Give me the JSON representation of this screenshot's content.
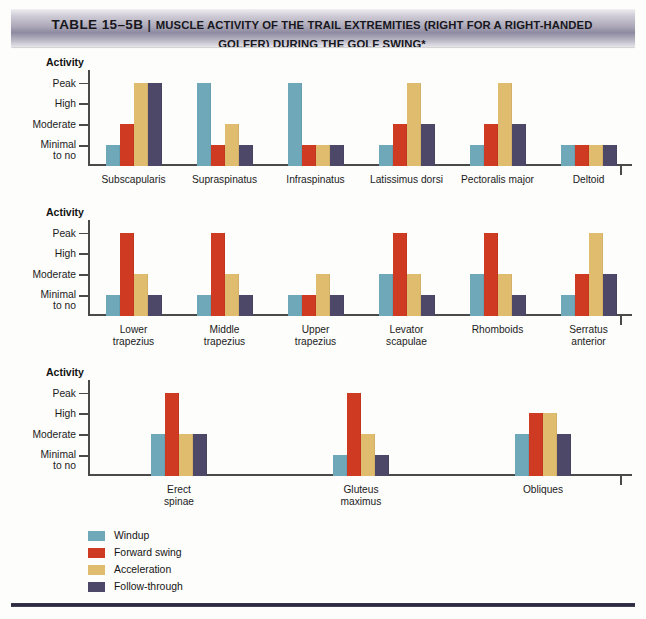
{
  "header": {
    "table_number": "TABLE 15–5B",
    "separator": "|",
    "title_line1": "MUSCLE ACTIVITY OF THE TRAIL EXTREMITIES (RIGHT FOR A RIGHT-HANDED",
    "title_line2": "GOLFER) DURING THE GOLF SWING*"
  },
  "axis_title": "Activity",
  "y_labels": {
    "peak": "Peak",
    "high": "High",
    "moderate": "Moderate",
    "minimal_l1": "Minimal",
    "minimal_l2": "to no"
  },
  "legend": {
    "items": [
      {
        "label": "Windup",
        "color": "#6fa8b8"
      },
      {
        "label": "Forward swing",
        "color": "#cf3a22"
      },
      {
        "label": "Acceleration",
        "color": "#e0bc6e"
      },
      {
        "label": "Follow-through",
        "color": "#4e4868"
      }
    ]
  },
  "colors": {
    "windup": "#6fa8b8",
    "forward_swing": "#cf3a22",
    "acceleration": "#e0bc6e",
    "follow_through": "#4e4868",
    "axis": "#4a4a4a",
    "page_bg": "#fdfdfb"
  },
  "chart_data": [
    {
      "type": "bar",
      "id": "shoulder-muscles",
      "title": "Activity",
      "xlabel": "",
      "ylabel": "Activity",
      "grid": false,
      "legend_position": "bottom",
      "ytick_labels": [
        "Minimal to no",
        "Moderate",
        "High",
        "Peak"
      ],
      "ytick_values": [
        1,
        2,
        3,
        4
      ],
      "ylim": [
        0,
        4
      ],
      "categories": [
        "Subscapularis",
        "Supraspinatus",
        "Infraspinatus",
        "Latissimus dorsi",
        "Pectoralis major",
        "Deltoid"
      ],
      "series": [
        {
          "name": "Windup",
          "values": [
            1,
            4,
            4,
            1,
            1,
            1
          ]
        },
        {
          "name": "Forward swing",
          "values": [
            2,
            1,
            1,
            2,
            2,
            1
          ]
        },
        {
          "name": "Acceleration",
          "values": [
            4,
            2,
            1,
            4,
            4,
            1
          ]
        },
        {
          "name": "Follow-through",
          "values": [
            4,
            1,
            1,
            2,
            2,
            1
          ]
        }
      ]
    },
    {
      "type": "bar",
      "id": "scapular-muscles",
      "title": "Activity",
      "xlabel": "",
      "ylabel": "Activity",
      "grid": false,
      "legend_position": "bottom",
      "ytick_labels": [
        "Minimal to no",
        "Moderate",
        "High",
        "Peak"
      ],
      "ytick_values": [
        1,
        2,
        3,
        4
      ],
      "ylim": [
        0,
        4
      ],
      "categories": [
        "Lower\ntrapezius",
        "Middle\ntrapezius",
        "Upper\ntrapezius",
        "Levator\nscapulae",
        "Rhomboids",
        "Serratus\nanterior"
      ],
      "series": [
        {
          "name": "Windup",
          "values": [
            1,
            1,
            1,
            2,
            2,
            1
          ]
        },
        {
          "name": "Forward swing",
          "values": [
            4,
            4,
            1,
            4,
            4,
            2
          ]
        },
        {
          "name": "Acceleration",
          "values": [
            2,
            2,
            2,
            2,
            2,
            4
          ]
        },
        {
          "name": "Follow-through",
          "values": [
            1,
            1,
            1,
            1,
            1,
            2
          ]
        }
      ]
    },
    {
      "type": "bar",
      "id": "trunk-muscles",
      "title": "Activity",
      "xlabel": "",
      "ylabel": "Activity",
      "grid": false,
      "legend_position": "bottom",
      "ytick_labels": [
        "Minimal to no",
        "Moderate",
        "High",
        "Peak"
      ],
      "ytick_values": [
        1,
        2,
        3,
        4
      ],
      "ylim": [
        0,
        4
      ],
      "categories": [
        "Erect\nspinae",
        "Gluteus\nmaximus",
        "Obliques"
      ],
      "series": [
        {
          "name": "Windup",
          "values": [
            2,
            1,
            2
          ]
        },
        {
          "name": "Forward swing",
          "values": [
            4,
            4,
            3
          ]
        },
        {
          "name": "Acceleration",
          "values": [
            2,
            2,
            3
          ]
        },
        {
          "name": "Follow-through",
          "values": [
            2,
            1,
            2
          ]
        }
      ]
    }
  ]
}
